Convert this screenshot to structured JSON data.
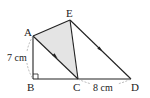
{
  "figure": {
    "points": {
      "A": {
        "label": "A",
        "x": 33,
        "y": 36
      },
      "E": {
        "label": "E",
        "x": 70,
        "y": 20
      },
      "B": {
        "label": "B",
        "x": 33,
        "y": 79
      },
      "C": {
        "label": "C",
        "x": 78,
        "y": 79
      },
      "D": {
        "label": "D",
        "x": 131,
        "y": 79
      }
    },
    "measurements": {
      "AB": "7 cm",
      "CD": "8 cm"
    },
    "shaded_region": "AEC",
    "parallel_marks": [
      "AC",
      "ED"
    ],
    "right_angle_at": "B",
    "colors": {
      "line": "#222222",
      "shade": "#e4e4e4",
      "dashed": "#999999"
    }
  }
}
